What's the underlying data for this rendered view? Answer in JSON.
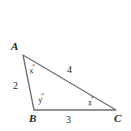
{
  "figure": {
    "type": "triangle-diagram",
    "width": 131,
    "height": 131,
    "background": "#ffffff",
    "stroke_color": "#6d6e71",
    "text_color": "#231f20",
    "vertices": [
      {
        "name": "A",
        "label": "A",
        "x": 23,
        "y": 55
      },
      {
        "name": "B",
        "label": "B",
        "x": 34,
        "y": 110
      },
      {
        "name": "C",
        "label": "C",
        "x": 116,
        "y": 110
      }
    ],
    "sides": [
      {
        "name": "side-ab",
        "label": "2",
        "from": "A",
        "to": "B"
      },
      {
        "name": "side-bc",
        "label": "3",
        "from": "B",
        "to": "C"
      },
      {
        "name": "side-ac",
        "label": "4",
        "from": "A",
        "to": "C"
      }
    ],
    "angles": [
      {
        "name": "angle-a",
        "variable": "x",
        "unit": "°",
        "at": "A"
      },
      {
        "name": "angle-b",
        "variable": "y",
        "unit": "°",
        "at": "B"
      },
      {
        "name": "angle-c",
        "variable": "z",
        "unit": "°",
        "at": "C"
      }
    ]
  }
}
